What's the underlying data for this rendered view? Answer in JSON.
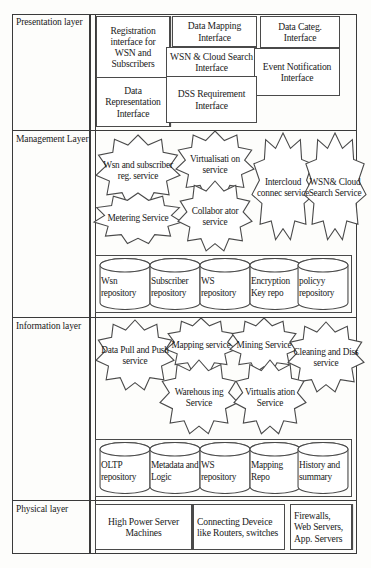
{
  "diagram": {
    "layers": [
      {
        "id": "presentation",
        "label": "Presentation layer"
      },
      {
        "id": "management",
        "label": "Management Layer"
      },
      {
        "id": "information",
        "label": "Information layer"
      },
      {
        "id": "physical",
        "label": "Physical layer"
      }
    ]
  },
  "presentation": {
    "nodes": [
      {
        "id": "registration",
        "label": "Registration interface for WSN and Subscribers"
      },
      {
        "id": "data-mapping",
        "label": "Data Mapping Interface"
      },
      {
        "id": "data-categ",
        "label": "Data Categ. Interface"
      },
      {
        "id": "wsn-cloud-search",
        "label": "WSN & Cloud Search Interface"
      },
      {
        "id": "event-notify",
        "label": "Event Notification Interface"
      },
      {
        "id": "data-repr",
        "label": "Data Representation Interface"
      },
      {
        "id": "dss-req",
        "label": "DSS Requirement Interface"
      }
    ]
  },
  "management": {
    "services": [
      {
        "id": "wsn-sub-reg",
        "label": "Wsn and subscriber reg. service"
      },
      {
        "id": "virtualisation",
        "label": "Virtualisati on service"
      },
      {
        "id": "intercloud-conn",
        "label": "Intercloud connec service"
      },
      {
        "id": "wsn-cloud-search",
        "label": "WSN& Cloud Search Service"
      },
      {
        "id": "metering",
        "label": "Metering Service"
      },
      {
        "id": "collaborator",
        "label": "Collabor ator service"
      }
    ],
    "repositories": [
      {
        "id": "wsn-repo",
        "label": "Wsn repository"
      },
      {
        "id": "subscriber-repo",
        "label": "Subscriber repository"
      },
      {
        "id": "ws-repo",
        "label": "WS repository"
      },
      {
        "id": "enc-key-repo",
        "label": "Encryption Key repo"
      },
      {
        "id": "policy-repo",
        "label": "policyy repository"
      }
    ]
  },
  "information": {
    "services": [
      {
        "id": "data-pull-push",
        "label": "Data Pull and Push service"
      },
      {
        "id": "mapping",
        "label": "Mapping service"
      },
      {
        "id": "mining",
        "label": "Mining Service"
      },
      {
        "id": "cleaning-diss",
        "label": "Cleaning and Diss service"
      },
      {
        "id": "warehousing",
        "label": "Warehous ing Service"
      },
      {
        "id": "virtualisation",
        "label": "Virtualis ation Service"
      }
    ],
    "repositories": [
      {
        "id": "oltp-repo",
        "label": "OLTP repository"
      },
      {
        "id": "metadata-logic",
        "label": "Metadata and Logic"
      },
      {
        "id": "ws-repo",
        "label": "WS repository"
      },
      {
        "id": "mapping-repo",
        "label": "Mapping Repo"
      },
      {
        "id": "history-summary",
        "label": "History and summary"
      }
    ]
  },
  "physical": {
    "nodes": [
      {
        "id": "servers",
        "label": "High Power Server Machines"
      },
      {
        "id": "network",
        "label": "Connecting Deveice like Routers, switches"
      },
      {
        "id": "security",
        "label": "Firewalls, Web Servers, App. Servers"
      }
    ]
  },
  "colors": {
    "stroke": "#3a3a3a",
    "node_stroke": "#4a4a4a",
    "fill": "#ffffff",
    "background": "#fdfdfb"
  }
}
